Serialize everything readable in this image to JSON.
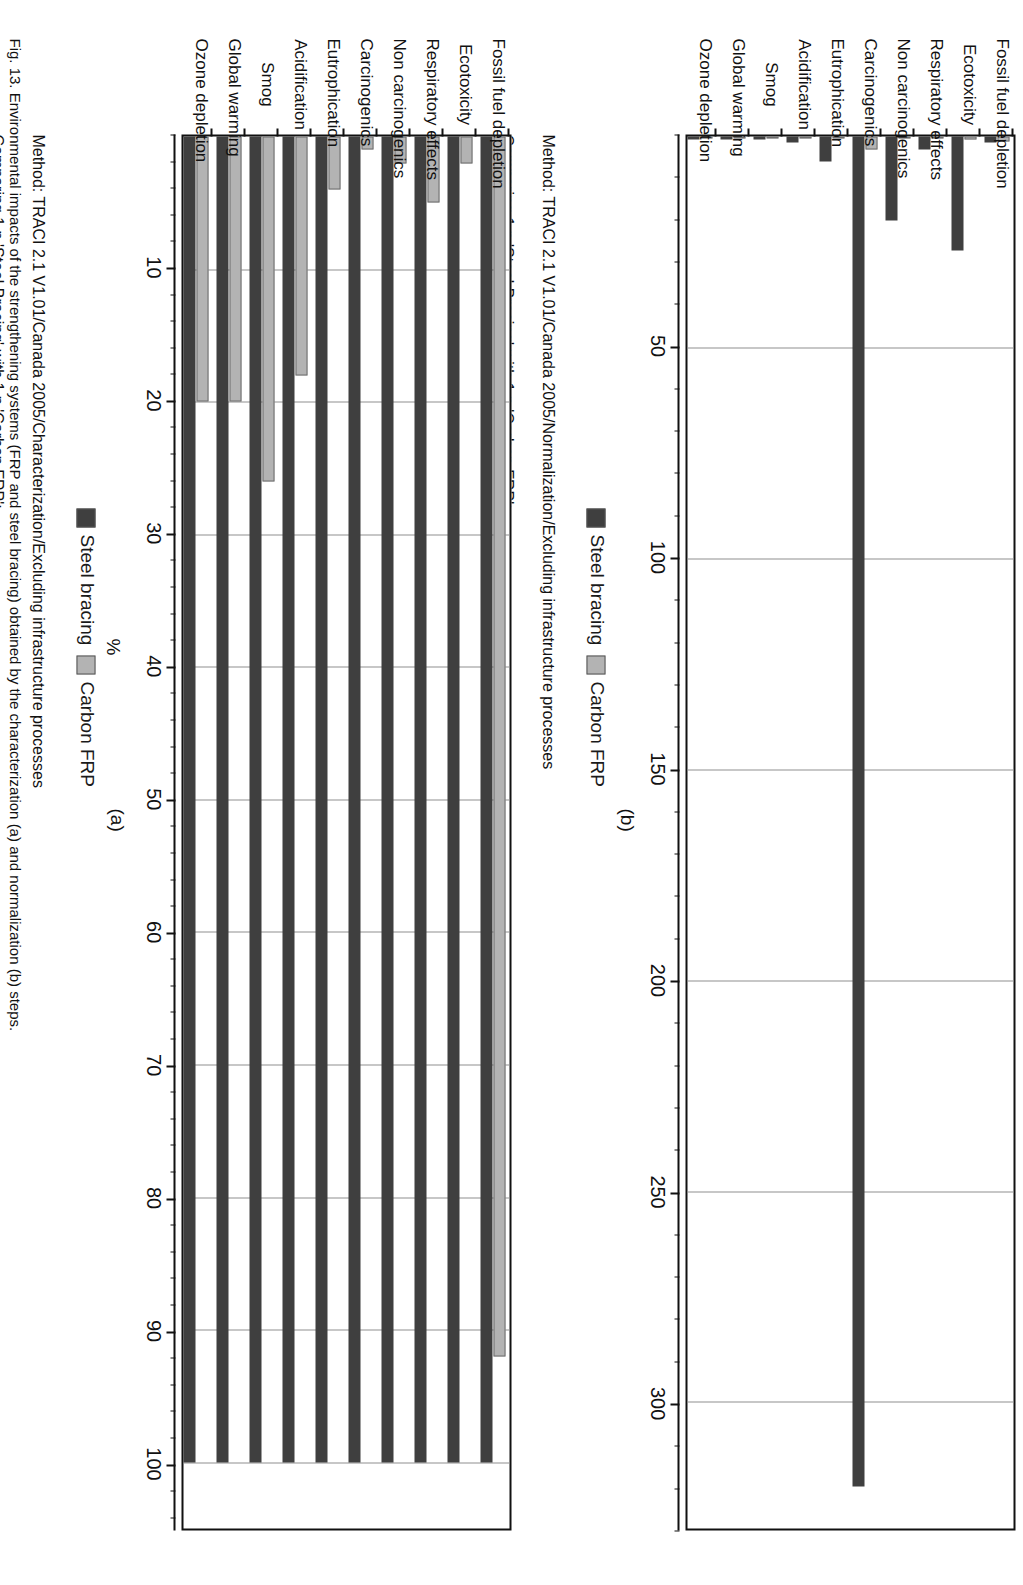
{
  "figure": {
    "caption": "Fig. 13. Environmental impacts of the strengthening systems (FRP and steel bracing) obtained by the characterization (a) and normalization (b) steps.",
    "panel_a_letter": "(a)",
    "panel_b_letter": "(b)"
  },
  "legend": {
    "steel_label": "Steel bracing",
    "frp_label": "Carbon FRP"
  },
  "method_note": {
    "line1": "Method: TRACI 2.1 V1.01/Canada 2005/Characterization/Excluding infrastructure processes",
    "line2": "Comparing 1 p 'Steel Bracing' with 1 p 'Carbon FRP';",
    "line1_b": "Method: TRACI 2.1 V1.01/Canada 2005/Normalization/Excluding infrastructure processes",
    "line2_b": "Comparing 1 p 'Steel Bracing' with 1 p 'Carbon FRP';"
  },
  "chart_data": [
    {
      "type": "bar",
      "orientation": "horizontal",
      "panel": "(a)",
      "title": "",
      "xlabel": "%",
      "ylabel": "",
      "xlim": [
        0,
        105
      ],
      "ticks": [
        10,
        20,
        30,
        40,
        50,
        60,
        70,
        80,
        90,
        100
      ],
      "tick_labels": [
        "10",
        "20",
        "30",
        "40",
        "50",
        "60",
        "70",
        "80",
        "90",
        "100"
      ],
      "minor_ticks_per_interval": 5,
      "grid": true,
      "legend_position": "below-plot",
      "categories": [
        "Ozone depletion",
        "Global warming",
        "Smog",
        "Acidification",
        "Eutrophication",
        "Carcinogenics",
        "Non carcinogenics",
        "Respiratory effects",
        "Ecotoxicity",
        "Fossil fuel depletion"
      ],
      "series": [
        {
          "name": "Steel bracing",
          "color": "#3f3f3f",
          "values": [
            100,
            100,
            100,
            100,
            100,
            100,
            100,
            100,
            100,
            100
          ]
        },
        {
          "name": "Carbon FRP",
          "color": "#b3b3b3",
          "values": [
            20,
            20,
            26,
            18,
            4,
            1,
            2,
            5,
            2,
            92
          ]
        }
      ]
    },
    {
      "type": "bar",
      "orientation": "horizontal",
      "panel": "(b)",
      "title": "",
      "xlabel": "",
      "ylabel": "",
      "xlim": [
        0,
        330
      ],
      "ticks": [
        50,
        100,
        150,
        200,
        250,
        300
      ],
      "tick_labels": [
        "50",
        "100",
        "150",
        "200",
        "250",
        "300"
      ],
      "minor_ticks_per_interval": 5,
      "grid": true,
      "legend_position": "below-plot",
      "categories": [
        "Ozone depletion",
        "Global warming",
        "Smog",
        "Acidification",
        "Eutrophication",
        "Carcinogenics",
        "Non carcinogenics",
        "Respiratory effects",
        "Ecotoxicity",
        "Fossil fuel depletion"
      ],
      "series": [
        {
          "name": "Steel bracing",
          "color": "#3f3f3f",
          "values": [
            0.2,
            0.5,
            0.6,
            1.5,
            6,
            320,
            20,
            3,
            27,
            1.5
          ]
        },
        {
          "name": "Carbon FRP",
          "color": "#b3b3b3",
          "values": [
            0.1,
            0.1,
            0.2,
            0.3,
            0.4,
            3,
            0.5,
            0.2,
            0.6,
            1.2
          ]
        }
      ]
    }
  ]
}
